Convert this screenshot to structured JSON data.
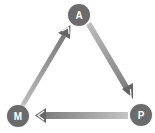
{
  "diagram": {
    "type": "cycle",
    "colors": {
      "node_fill": "#6b6b6b",
      "node_glow": "#d8d8d8",
      "arrow_light": "#c4c4c4",
      "arrow_dark": "#6a6a6a",
      "label": "#ffffff"
    },
    "nodes": [
      {
        "id": "A",
        "label": "A"
      },
      {
        "id": "P",
        "label": "P"
      },
      {
        "id": "M",
        "label": "M"
      }
    ],
    "edges": [
      {
        "from": "M",
        "to": "A"
      },
      {
        "from": "A",
        "to": "P"
      },
      {
        "from": "P",
        "to": "M"
      }
    ]
  }
}
